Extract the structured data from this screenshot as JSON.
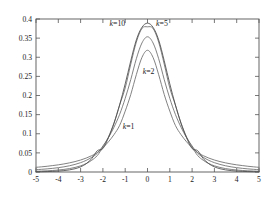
{
  "chart_data": {
    "type": "line",
    "title": "",
    "subtitle": "",
    "xlabel": "",
    "ylabel": "",
    "xlim": [
      -5,
      5
    ],
    "ylim": [
      0,
      0.4
    ],
    "grid": false,
    "legend_position": "inline-annotations",
    "x_ticks": [
      "-5",
      "-4",
      "-3",
      "-2",
      "-1",
      "0",
      "1",
      "2",
      "3",
      "4",
      "5"
    ],
    "x_tick_values": [
      -5,
      -4,
      -3,
      -2,
      -1,
      0,
      1,
      2,
      3,
      4,
      5
    ],
    "y_ticks": [
      "0",
      "0.05",
      "0.1",
      "0.15",
      "0.2",
      "0.25",
      "0.3",
      "0.35",
      "0.4"
    ],
    "y_tick_values": [
      0,
      0.05,
      0.1,
      0.15,
      0.2,
      0.25,
      0.3,
      0.35,
      0.4
    ],
    "x": [
      -5,
      -4.75,
      -4.5,
      -4.25,
      -4,
      -3.75,
      -3.5,
      -3.25,
      -3,
      -2.75,
      -2.5,
      -2.25,
      -2,
      -1.75,
      -1.5,
      -1.25,
      -1,
      -0.75,
      -0.5,
      -0.25,
      0,
      0.25,
      0.5,
      0.75,
      1,
      1.25,
      1.5,
      1.75,
      2,
      2.25,
      2.5,
      2.75,
      3,
      3.25,
      3.5,
      3.75,
      4,
      4.25,
      4.5,
      4.75,
      5
    ],
    "series": [
      {
        "name": "k=1",
        "label": "k=1",
        "color": "#6b6b6b",
        "peak": 0.3183,
        "values": [
          0.01224,
          0.01353,
          0.01504,
          0.01682,
          0.01872,
          0.02107,
          0.02387,
          0.02723,
          0.03133,
          0.03639,
          0.04272,
          0.05077,
          0.06366,
          0.07908,
          0.09794,
          0.12184,
          0.15915,
          0.20264,
          0.25465,
          0.29941,
          0.31831,
          0.29941,
          0.25465,
          0.20264,
          0.15915,
          0.12184,
          0.09794,
          0.07908,
          0.06366,
          0.05077,
          0.04272,
          0.03639,
          0.03133,
          0.02723,
          0.02387,
          0.02107,
          0.01872,
          0.01682,
          0.01504,
          0.01353,
          0.01224
        ]
      },
      {
        "name": "k=2",
        "label": "k=2",
        "color": "#6b6b6b",
        "peak": 0.3536,
        "values": [
          0.00607,
          0.00701,
          0.00816,
          0.00957,
          0.01132,
          0.01351,
          0.01628,
          0.01983,
          0.02441,
          0.03041,
          0.03833,
          0.04893,
          0.06804,
          0.08998,
          0.11755,
          0.15058,
          0.19245,
          0.24166,
          0.29629,
          0.33733,
          0.35355,
          0.33733,
          0.29629,
          0.24166,
          0.19245,
          0.15058,
          0.11755,
          0.08998,
          0.06804,
          0.04893,
          0.03833,
          0.03041,
          0.02441,
          0.01983,
          0.01628,
          0.01351,
          0.01132,
          0.00957,
          0.00816,
          0.00701,
          0.00607
        ]
      },
      {
        "name": "k=5",
        "label": "k=5",
        "color": "#6b6b6b",
        "peak": 0.3796,
        "values": [
          0.00195,
          0.00245,
          0.00312,
          0.00401,
          0.00518,
          0.00677,
          0.00894,
          0.01193,
          0.01614,
          0.02209,
          0.03065,
          0.04305,
          0.06509,
          0.09196,
          0.12885,
          0.17507,
          0.21968,
          0.28203,
          0.33968,
          0.37534,
          0.37961,
          0.37534,
          0.33968,
          0.28203,
          0.21968,
          0.17507,
          0.12885,
          0.09196,
          0.06509,
          0.04305,
          0.03065,
          0.02209,
          0.01614,
          0.01193,
          0.00894,
          0.00677,
          0.00518,
          0.00401,
          0.00312,
          0.00245,
          0.00195
        ]
      },
      {
        "name": "k=10",
        "label": "k=10",
        "color": "#4a4a4a",
        "peak": 0.3891,
        "values": [
          0.00054,
          0.00077,
          0.00111,
          0.00163,
          0.00241,
          0.00362,
          0.00552,
          0.00855,
          0.01346,
          0.02155,
          0.03505,
          0.05574,
          0.06114,
          0.08997,
          0.12744,
          0.17554,
          0.23036,
          0.29071,
          0.34546,
          0.37831,
          0.3891,
          0.37831,
          0.34546,
          0.29071,
          0.23036,
          0.17554,
          0.12744,
          0.08997,
          0.06114,
          0.05574,
          0.03505,
          0.02155,
          0.01346,
          0.00855,
          0.00552,
          0.00362,
          0.00241,
          0.00163,
          0.00111,
          0.00077,
          0.00054
        ]
      }
    ],
    "annotations": [
      {
        "text": "k=10",
        "var": "k",
        "eq": "=10",
        "x": -1.35,
        "y": 0.383
      },
      {
        "text": "k=5",
        "var": "k",
        "eq": "=5",
        "x": 0.65,
        "y": 0.383
      },
      {
        "text": "k=2",
        "var": "k",
        "eq": "=2",
        "x": 0.05,
        "y": 0.257
      },
      {
        "text": "k=1",
        "var": "k",
        "eq": "=1",
        "x": -0.85,
        "y": 0.112
      }
    ]
  }
}
